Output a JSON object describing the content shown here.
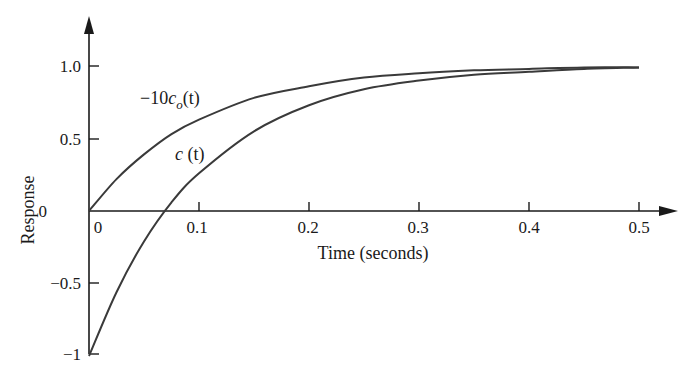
{
  "chart_data": {
    "type": "line",
    "title": "",
    "xlabel": "Time (seconds)",
    "ylabel": "Response",
    "xlim": [
      0,
      0.5
    ],
    "ylim": [
      -1,
      1.2
    ],
    "grid": false,
    "legend": "none (curves labeled inline)",
    "x_ticks": [
      "0",
      "0.1",
      "0.2",
      "0.3",
      "0.4",
      "0.5"
    ],
    "y_ticks": [
      "1.0",
      "0.5",
      "0",
      "−0.5",
      "−1"
    ],
    "x": [
      0,
      0.025,
      0.05,
      0.075,
      0.1,
      0.15,
      0.2,
      0.25,
      0.3,
      0.35,
      0.4,
      0.45,
      0.5
    ],
    "series": [
      {
        "name": "-10c_o(t)",
        "label_main": "−10",
        "label_var": "c",
        "label_sub": "o",
        "label_arg": "(t)",
        "values": [
          0,
          0.22,
          0.39,
          0.53,
          0.63,
          0.78,
          0.86,
          0.92,
          0.95,
          0.97,
          0.98,
          0.99,
          0.99
        ]
      },
      {
        "name": "c(t)",
        "label_var": "c",
        "label_arg": "(t)",
        "values": [
          -1,
          -0.56,
          -0.21,
          0.06,
          0.26,
          0.55,
          0.73,
          0.84,
          0.9,
          0.94,
          0.96,
          0.98,
          0.99
        ]
      }
    ],
    "annotations": [
      "−10c_o(t)",
      "c (t)"
    ]
  },
  "axes": {
    "x_title": "Time (seconds)",
    "y_title": "Response",
    "x_tick_labels": [
      "0",
      "0.1",
      "0.2",
      "0.3",
      "0.4",
      "0.5"
    ],
    "y_tick_labels": [
      "1.0",
      "0.5",
      "0",
      "−0.5",
      "−1"
    ]
  },
  "labels": {
    "upper_prefix": "−10",
    "upper_var": "c",
    "upper_sub": "o",
    "upper_arg": "(t)",
    "lower_var": "c",
    "lower_arg": " (t)"
  }
}
